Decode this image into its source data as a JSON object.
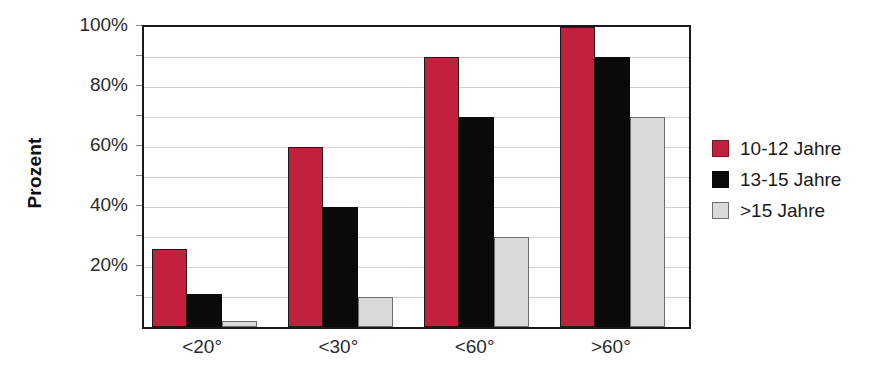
{
  "chart_data": {
    "type": "bar",
    "title": "",
    "subtitle": "",
    "xlabel": "",
    "ylabel": "Prozent",
    "categories": [
      "<20°",
      "<30°",
      "<60°",
      ">60°"
    ],
    "series": [
      {
        "name": "10-12 Jahre",
        "color": "#C2203C",
        "values": [
          26,
          60,
          90,
          100
        ]
      },
      {
        "name": "13-15 Jahre",
        "color": "#0A0A0A",
        "values": [
          11,
          40,
          70,
          90
        ]
      },
      {
        "name": ">15 Jahre",
        "color": "#D9D9D9",
        "values": [
          2,
          10,
          30,
          70
        ]
      }
    ],
    "ylim": [
      0,
      100
    ],
    "y_major_ticks": [
      20,
      40,
      60,
      80,
      100
    ],
    "y_tick_labels": [
      "20%",
      "40%",
      "60%",
      "80%",
      "100%"
    ],
    "y_minor_gridlines": [
      10,
      20,
      30,
      40,
      50,
      60,
      70,
      80,
      90
    ],
    "grid": true,
    "grid_color": "#CFCFCF",
    "legend_position": "right",
    "axis_color": "#1A1A1A",
    "background": "#FFFFFF"
  },
  "legend": {
    "items": [
      {
        "label": "10-12 Jahre"
      },
      {
        "label": "13-15 Jahre"
      },
      {
        "label": ">15 Jahre"
      }
    ]
  },
  "y_axis": {
    "title": "Prozent",
    "ticks": [
      {
        "label": "100%",
        "value": 100
      },
      {
        "label": "80%",
        "value": 80
      },
      {
        "label": "60%",
        "value": 60
      },
      {
        "label": "40%",
        "value": 40
      },
      {
        "label": "20%",
        "value": 20
      }
    ]
  },
  "x_axis": {
    "ticks": [
      {
        "label": "<20°"
      },
      {
        "label": "<30°"
      },
      {
        "label": "<60°"
      },
      {
        "label": ">60°"
      }
    ]
  }
}
